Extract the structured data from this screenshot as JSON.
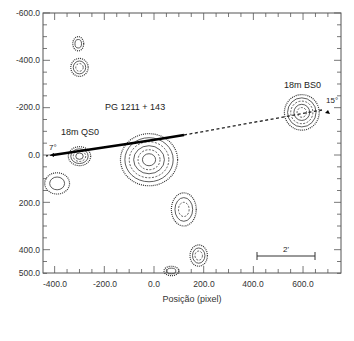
{
  "chart_data": {
    "type": "contour",
    "title": "",
    "xlabel": "Posição (pixel)",
    "ylabel": "",
    "xlim": [
      -447,
      752
    ],
    "ylim": [
      -600,
      500
    ],
    "y_inverted": true,
    "grid": false,
    "x_ticks": [
      -400,
      -200,
      0,
      200,
      400,
      600
    ],
    "x_tick_labels": [
      "-400.0",
      "-200.0",
      "0.0",
      "200.0",
      "400.0",
      "600.0"
    ],
    "y_ticks": [
      -600,
      -400,
      -200,
      0,
      200,
      400,
      500
    ],
    "y_tick_labels": [
      "-600.0",
      "-400.0",
      "-200.0",
      "0.0",
      "200.0",
      "400.0",
      "500.0"
    ],
    "annotations": [
      {
        "text": "PG 1211 + 143",
        "x": -130,
        "y": -135
      },
      {
        "text": "18m QS0",
        "x": -390,
        "y": -50
      },
      {
        "text": "18m BS0",
        "x": 485,
        "y": -250
      },
      {
        "text": "7°",
        "x": -425,
        "y": -25
      },
      {
        "text": "15°",
        "x": 670,
        "y": -160
      },
      {
        "text": "2'",
        "x": 520,
        "y": 360
      }
    ],
    "scale_bar": {
      "label": "2'",
      "x_start": 410,
      "x_end": 645,
      "y": 388
    },
    "slit_line": {
      "solid": {
        "x": [
          -310,
          0,
          120
        ],
        "y": [
          5,
          -40,
          -80
        ]
      },
      "dashed": {
        "x": [
          120,
          665
        ],
        "y": [
          -80,
          -185
        ]
      },
      "dashed_left": {
        "x": [
          -430,
          -310
        ],
        "y": [
          10,
          5
        ]
      }
    },
    "sources": [
      {
        "name": "PG 1211 + 143",
        "x": -20,
        "y": 20,
        "rx": 115,
        "ry": 110,
        "levels": 6
      },
      {
        "name": "18m QS0",
        "x": -300,
        "y": 5,
        "rx": 45,
        "ry": 40,
        "levels": 4
      },
      {
        "name": "18m BS0",
        "x": 595,
        "y": -180,
        "rx": 70,
        "ry": 75,
        "levels": 5
      },
      {
        "name": "blob-a",
        "x": -300,
        "y": -370,
        "rx": 35,
        "ry": 38,
        "levels": 3
      },
      {
        "name": "blob-b",
        "x": -305,
        "y": -470,
        "rx": 22,
        "ry": 30,
        "levels": 2
      },
      {
        "name": "blob-c",
        "x": -390,
        "y": 120,
        "rx": 50,
        "ry": 45,
        "levels": 2
      },
      {
        "name": "blob-d",
        "x": 120,
        "y": 230,
        "rx": 50,
        "ry": 70,
        "levels": 3
      },
      {
        "name": "blob-e",
        "x": 180,
        "y": 425,
        "rx": 35,
        "ry": 45,
        "levels": 3
      },
      {
        "name": "blob-f",
        "x": 70,
        "y": 490,
        "rx": 30,
        "ry": 20,
        "levels": 2
      }
    ]
  },
  "labels": {
    "xlabel": "Posição (pixel)",
    "pg": "PG 1211 + 143",
    "qso": "18m QS0",
    "bso": "18m BS0",
    "angle_left": "7°",
    "angle_right": "15°",
    "scale": "2'"
  },
  "ticks": {
    "x": [
      "-400.0",
      "-200.0",
      "0.0",
      "200.0",
      "400.0",
      "600.0"
    ],
    "y": [
      "-600.0",
      "-400.0",
      "-200.0",
      "0.0",
      "200.0",
      "400.0",
      "500.0"
    ]
  }
}
